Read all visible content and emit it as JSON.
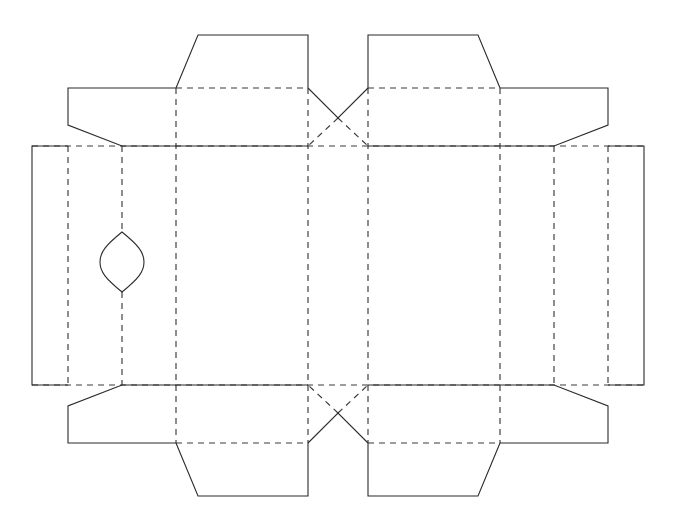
{
  "document": {
    "title": "Box Dieline Template",
    "kind": "packaging-dieline",
    "canvas": {
      "width": 676,
      "height": 531,
      "background": "#ffffff"
    },
    "symmetry": {
      "vertical_axis_x": 338,
      "horizontal_axis_y": 265.5
    }
  },
  "style": {
    "cut_color": "#2b2b2b",
    "fold_color": "#3a3a3a",
    "cut_stroke_width": 1.1,
    "fold_stroke_width": 1.15,
    "fold_dash_pattern": "6 5"
  },
  "legend": {
    "cut_label": "Cut line (solid)",
    "fold_label": "Fold / crease line (dashed)",
    "aperture_label": "Die-cut aperture"
  },
  "geometry": {
    "fold_vertical_x": [
      68,
      122,
      176,
      308,
      368,
      500,
      554,
      608
    ],
    "fold_horizontal_y": [
      88,
      146,
      385,
      443
    ],
    "panel_left_x": 32,
    "panel_right_x": 644,
    "body_top_y": 146,
    "body_bottom_y": 385
  },
  "aperture": {
    "name": "leaf-aperture",
    "center_x": 122,
    "center_y": 262,
    "half_width": 22,
    "half_height": 30,
    "top_y": 232,
    "bottom_y": 292
  },
  "cut_paths": [
    {
      "name": "top-left-tuck-tab",
      "d": "M 176 88 L 198 35 L 308 35 L 308 88"
    },
    {
      "name": "top-right-tuck-tab",
      "d": "M 368 88 L 368 35 L 478 35 L 500 88"
    },
    {
      "name": "top-left-dust-flap",
      "d": "M 176 88 L 68 88 L 68 125 L 122 146 L 176 146"
    },
    {
      "name": "top-right-dust-flap",
      "d": "M 500 88 L 608 88 L 608 125 L 554 146 L 500 146"
    },
    {
      "name": "top-center-notch",
      "d": "M 308 88 L 338 118 L 368 88"
    },
    {
      "name": "left-glue-flap",
      "d": "M 68 146 L 32 146 L 32 385 L 68 385"
    },
    {
      "name": "right-glue-flap",
      "d": "M 608 146 L 644 146 L 644 385 L 608 385"
    },
    {
      "name": "top-left-outer-edge",
      "d": "M 176 146 L 308 146"
    },
    {
      "name": "top-right-outer-edge",
      "d": "M 368 146 L 500 146"
    },
    {
      "name": "bottom-left-dust-flap",
      "d": "M 176 443 L 68 443 L 68 406 L 122 385 L 176 385"
    },
    {
      "name": "bottom-right-dust-flap",
      "d": "M 500 443 L 608 443 L 608 406 L 554 385 L 500 385"
    },
    {
      "name": "bottom-left-tuck-tab",
      "d": "M 176 443 L 198 496 L 308 496 L 308 443"
    },
    {
      "name": "bottom-right-tuck-tab",
      "d": "M 368 443 L 368 496 L 478 496 L 500 443"
    },
    {
      "name": "bottom-center-notch",
      "d": "M 308 443 L 338 413 L 368 443"
    },
    {
      "name": "bottom-left-outer-edge",
      "d": "M 176 385 L 308 385"
    },
    {
      "name": "bottom-right-outer-edge",
      "d": "M 368 385 L 500 385"
    }
  ],
  "fold_paths": [
    {
      "name": "fold-vertical-1",
      "d": "M 68 146 L 68 385"
    },
    {
      "name": "fold-vertical-2",
      "d": "M 122 146 L 122 232"
    },
    {
      "name": "fold-vertical-2b",
      "d": "M 122 292 L 122 385"
    },
    {
      "name": "fold-vertical-3",
      "d": "M 176 88 L 176 443"
    },
    {
      "name": "fold-vertical-4",
      "d": "M 308 88 L 308 443"
    },
    {
      "name": "fold-vertical-5",
      "d": "M 368 88 L 368 443"
    },
    {
      "name": "fold-vertical-6",
      "d": "M 500 88 L 500 443"
    },
    {
      "name": "fold-vertical-7",
      "d": "M 554 146 L 554 385"
    },
    {
      "name": "fold-vertical-8",
      "d": "M 608 146 L 608 385"
    },
    {
      "name": "fold-horizontal-top-upper",
      "d": "M 176 88 L 308 88"
    },
    {
      "name": "fold-horizontal-top-upper-right",
      "d": "M 368 88 L 500 88"
    },
    {
      "name": "fold-horizontal-top-main",
      "d": "M 32 146 L 644 146"
    },
    {
      "name": "fold-horizontal-bottom-main",
      "d": "M 32 385 L 644 385"
    },
    {
      "name": "fold-horizontal-bottom-lower",
      "d": "M 176 443 L 308 443"
    },
    {
      "name": "fold-horizontal-bottom-lower-right",
      "d": "M 368 443 L 500 443"
    },
    {
      "name": "fold-notch-top-left",
      "d": "M 338 118 L 308 146"
    },
    {
      "name": "fold-notch-top-right",
      "d": "M 338 118 L 368 146"
    },
    {
      "name": "fold-notch-bottom-left",
      "d": "M 338 413 L 308 385"
    },
    {
      "name": "fold-notch-bottom-right",
      "d": "M 338 413 L 368 385"
    }
  ],
  "aperture_paths": [
    {
      "name": "leaf-aperture-outline",
      "d": "M 122 232 C 106 245 100 252 100 262 C 100 272 106 279 122 292 C 138 279 144 272 144 262 C 144 252 138 245 122 232 Z"
    }
  ]
}
